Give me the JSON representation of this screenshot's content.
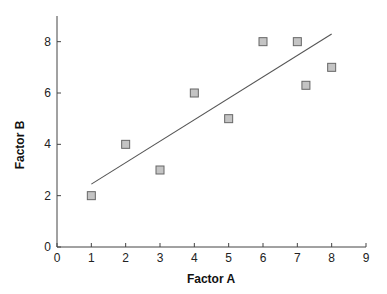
{
  "chart_data": {
    "type": "scatter",
    "title": "",
    "xlabel": "Factor A",
    "ylabel": "Factor B",
    "xlim": [
      0,
      9
    ],
    "ylim": [
      0,
      9
    ],
    "x_ticks": [
      "0",
      "1",
      "2",
      "3",
      "4",
      "5",
      "6",
      "7",
      "8",
      "9"
    ],
    "y_ticks": [
      "0",
      "2",
      "4",
      "6",
      "8"
    ],
    "grid": false,
    "legend": null,
    "series": [
      {
        "name": "observations",
        "marker": "square",
        "points": [
          {
            "x": 1,
            "y": 2
          },
          {
            "x": 2,
            "y": 4
          },
          {
            "x": 3,
            "y": 3
          },
          {
            "x": 4,
            "y": 6
          },
          {
            "x": 5,
            "y": 5
          },
          {
            "x": 6,
            "y": 8
          },
          {
            "x": 7,
            "y": 8
          },
          {
            "x": 7.25,
            "y": 6.3
          },
          {
            "x": 8,
            "y": 7
          }
        ]
      }
    ],
    "trendline": {
      "type": "linear",
      "x_start": 1,
      "y_start": 2.45,
      "x_end": 8,
      "y_end": 8.3
    },
    "colors": {
      "marker_fill": "#c4c4c4",
      "marker_stroke": "#666666",
      "line": "#555555",
      "axis": "#444444"
    }
  }
}
